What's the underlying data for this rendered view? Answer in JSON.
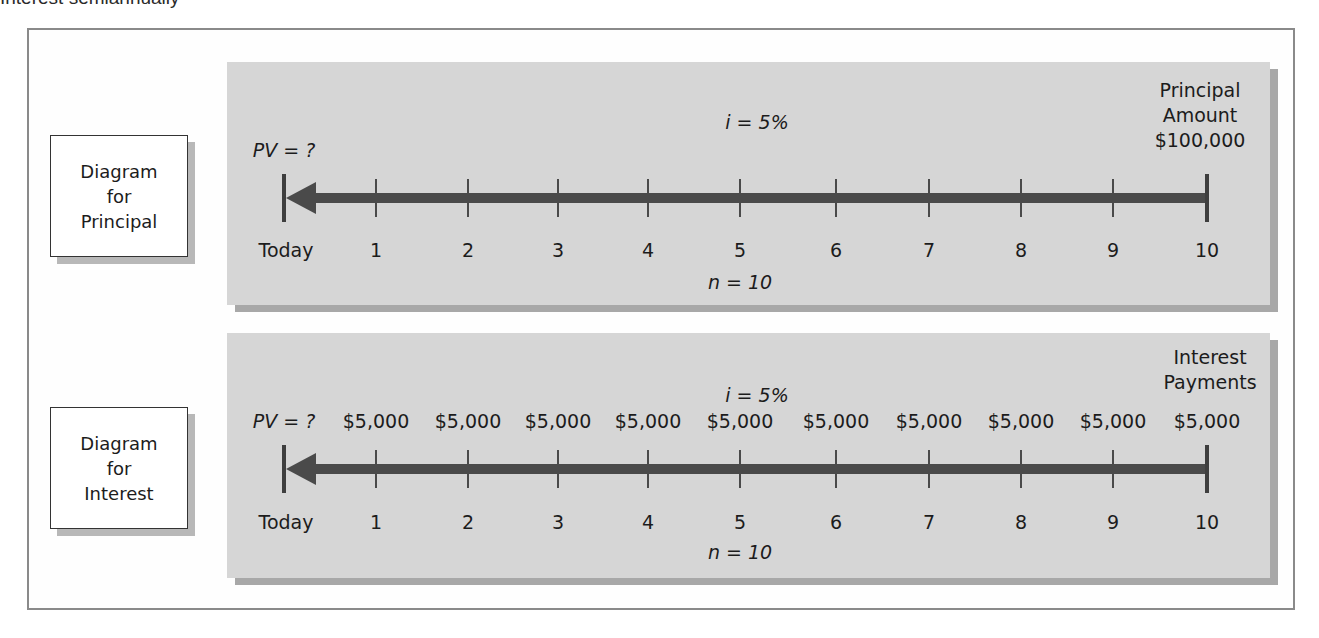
{
  "header": {
    "partial_title": "Interest semiannually"
  },
  "diagrams": [
    {
      "id": "principal",
      "box_label": [
        "Diagram",
        "for",
        "Principal"
      ],
      "pv_label": "PV = ?",
      "rate_label": "i = 5%",
      "periods_label": "n = 10",
      "right_label": [
        "Principal",
        "Amount",
        "$100,000"
      ],
      "timeline": [
        "Today",
        "1",
        "2",
        "3",
        "4",
        "5",
        "6",
        "7",
        "8",
        "9",
        "10"
      ],
      "payments": []
    },
    {
      "id": "interest",
      "box_label": [
        "Diagram",
        "for",
        "Interest"
      ],
      "pv_label": "PV = ?",
      "rate_label": "i = 5%",
      "periods_label": "n = 10",
      "right_label": [
        "Interest",
        "Payments"
      ],
      "timeline": [
        "Today",
        "1",
        "2",
        "3",
        "4",
        "5",
        "6",
        "7",
        "8",
        "9",
        "10"
      ],
      "payments": [
        "$5,000",
        "$5,000",
        "$5,000",
        "$5,000",
        "$5,000",
        "$5,000",
        "$5,000",
        "$5,000",
        "$5,000",
        "$5,000"
      ]
    }
  ],
  "colors": {
    "panel": "#d6d6d6",
    "arrow": "#4a4a4a",
    "frame": "#8a8a8a"
  }
}
